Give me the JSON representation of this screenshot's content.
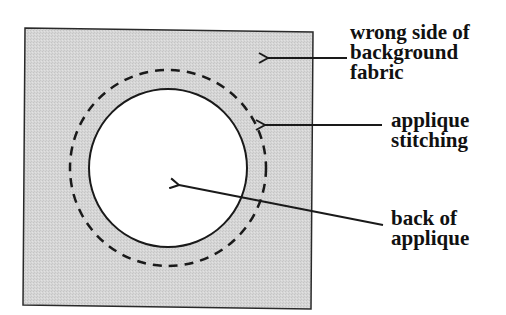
{
  "diagram": {
    "colors": {
      "fabric_fill": "#d4d4d4",
      "applique_fill": "#ffffff",
      "stroke": "#1a1a1a"
    },
    "labels": [
      {
        "id": "background",
        "lines": [
          "wrong side of",
          "background",
          "fabric"
        ]
      },
      {
        "id": "stitching",
        "lines": [
          "applique",
          "stitching"
        ]
      },
      {
        "id": "applique",
        "lines": [
          "back of",
          "applique"
        ]
      }
    ]
  }
}
